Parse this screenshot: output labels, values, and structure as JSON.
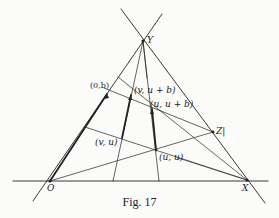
{
  "figure": {
    "caption": "Fig. 17",
    "points": {
      "Y": {
        "label": "Y",
        "x": 143,
        "y": 41
      },
      "O": {
        "label": "O",
        "x": 50,
        "y": 181
      },
      "X": {
        "label": "X",
        "x": 247,
        "y": 180
      },
      "Z": {
        "label": "Z|",
        "x": 213,
        "y": 132
      },
      "p0b": {
        "label": "(0,b)",
        "x": 107,
        "y": 94
      },
      "pvub": {
        "label": "(v, u + b)",
        "x": 131,
        "y": 97
      },
      "puub": {
        "label": "(u, u + b)",
        "x": 153,
        "y": 110
      },
      "pvu": {
        "label": "(v, u)",
        "x": 122,
        "y": 138
      },
      "puu": {
        "label": "(u, u)",
        "x": 156,
        "y": 150
      }
    },
    "colors": {
      "line": "#222222",
      "background": "#fbfbfa"
    }
  }
}
